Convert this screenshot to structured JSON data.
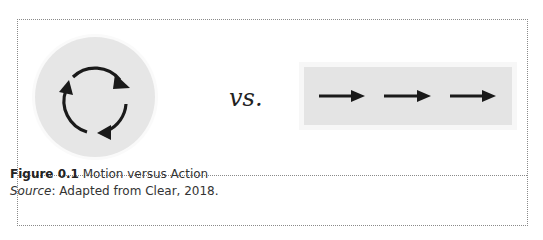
{
  "figure": {
    "left_panel": {
      "icon": "cycle-arrows-icon",
      "description": "three curved arrows forming a circular loop"
    },
    "separator_text": "vs.",
    "right_panel": {
      "icon": "forward-arrows-icon",
      "arrow_count": 3,
      "description": "three straight right-pointing arrows in a row"
    },
    "colors": {
      "panel_fill": "#e5e5e5",
      "arrow": "#1a1a1a",
      "border": "#8a8a8a"
    }
  },
  "caption": {
    "label": "Figure 0.1",
    "title": " Motion versus Action",
    "source_label": "Source",
    "source_text": ": Adapted from Clear, 2018."
  }
}
